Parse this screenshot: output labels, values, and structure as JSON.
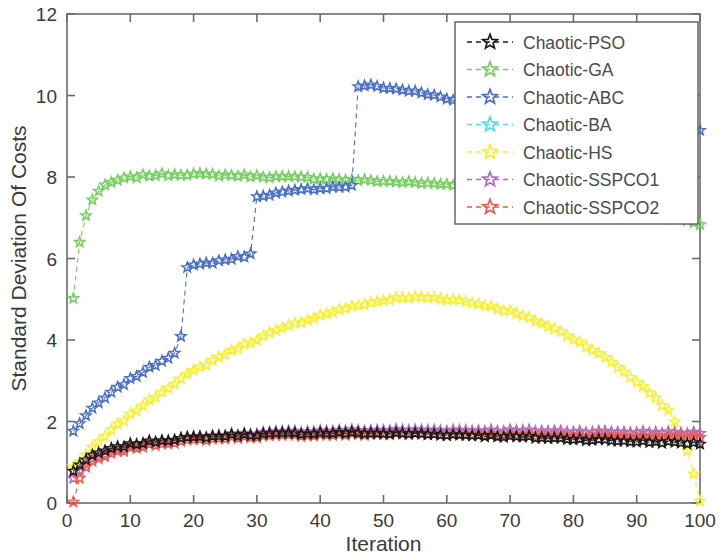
{
  "chart_data": {
    "type": "line",
    "title": "",
    "xlabel": "Iteration",
    "ylabel": "Standard Deviation Of Costs",
    "xlim": [
      0,
      100
    ],
    "ylim": [
      0,
      12
    ],
    "xticks": [
      0,
      10,
      20,
      30,
      40,
      50,
      60,
      70,
      80,
      90,
      100
    ],
    "yticks": [
      0,
      2,
      4,
      6,
      8,
      10,
      12
    ],
    "grid": false,
    "marker": "star",
    "linestyle": "dashed",
    "legend_position": "upper right",
    "series": [
      {
        "name": "Chaotic-PSO",
        "color": "#1a1a1a",
        "x": [
          1,
          2,
          3,
          4,
          5,
          6,
          7,
          8,
          9,
          10,
          12,
          14,
          16,
          18,
          20,
          22,
          25,
          28,
          30,
          34,
          38,
          42,
          46,
          50,
          55,
          60,
          65,
          70,
          75,
          80,
          85,
          90,
          95,
          98,
          100
        ],
        "values": [
          0.78,
          0.95,
          1.06,
          1.15,
          1.22,
          1.28,
          1.32,
          1.36,
          1.4,
          1.43,
          1.48,
          1.52,
          1.55,
          1.58,
          1.6,
          1.62,
          1.65,
          1.67,
          1.68,
          1.7,
          1.71,
          1.72,
          1.72,
          1.71,
          1.7,
          1.68,
          1.66,
          1.63,
          1.6,
          1.57,
          1.54,
          1.51,
          1.49,
          1.47,
          1.46
        ]
      },
      {
        "name": "Chaotic-GA",
        "color": "#76cf61",
        "x": [
          1,
          2,
          3,
          4,
          5,
          6,
          7,
          8,
          9,
          10,
          12,
          14,
          16,
          18,
          20,
          24,
          28,
          32,
          36,
          40,
          45,
          50,
          55,
          60,
          65,
          70,
          75,
          80,
          85,
          90,
          95,
          98,
          100
        ],
        "values": [
          5.02,
          6.4,
          7.05,
          7.45,
          7.65,
          7.78,
          7.86,
          7.92,
          7.96,
          7.99,
          8.03,
          8.05,
          8.06,
          8.07,
          8.07,
          8.05,
          8.03,
          8.01,
          7.99,
          7.97,
          7.93,
          7.9,
          7.86,
          7.82,
          7.77,
          7.7,
          7.62,
          7.52,
          7.4,
          7.26,
          7.05,
          6.92,
          6.85
        ]
      },
      {
        "name": "Chaotic-ABC",
        "color": "#4a6fc4",
        "x": [
          1,
          2,
          3,
          4,
          5,
          6,
          7,
          8,
          9,
          10,
          12,
          14,
          16,
          17,
          18,
          19,
          20,
          22,
          24,
          26,
          28,
          29,
          30,
          32,
          34,
          36,
          38,
          40,
          42,
          44,
          45,
          46,
          47,
          48,
          50,
          52,
          54,
          56,
          58,
          60,
          62,
          63,
          100
        ],
        "values": [
          1.76,
          1.96,
          2.14,
          2.3,
          2.45,
          2.58,
          2.7,
          2.82,
          2.93,
          3.03,
          3.22,
          3.4,
          3.58,
          3.7,
          4.08,
          5.78,
          5.82,
          5.88,
          5.94,
          6.0,
          6.06,
          6.1,
          7.52,
          7.58,
          7.62,
          7.66,
          7.7,
          7.73,
          7.75,
          7.77,
          7.78,
          10.22,
          10.25,
          10.24,
          10.2,
          10.16,
          10.12,
          10.06,
          10.0,
          9.92,
          9.84,
          9.8,
          9.15
        ]
      },
      {
        "name": "Chaotic-BA",
        "color": "#55dcec",
        "x": [],
        "values": []
      },
      {
        "name": "Chaotic-HS",
        "color": "#f7f035",
        "x": [
          1,
          2,
          3,
          4,
          5,
          6,
          8,
          10,
          12,
          14,
          16,
          18,
          20,
          24,
          28,
          32,
          36,
          40,
          44,
          48,
          52,
          55,
          58,
          62,
          66,
          70,
          74,
          78,
          82,
          86,
          90,
          93,
          95,
          97,
          98,
          99,
          100
        ],
        "values": [
          0.88,
          1.02,
          1.18,
          1.34,
          1.5,
          1.64,
          1.92,
          2.16,
          2.4,
          2.62,
          2.84,
          3.04,
          3.24,
          3.58,
          3.88,
          4.16,
          4.4,
          4.6,
          4.78,
          4.92,
          5.02,
          5.05,
          5.04,
          4.98,
          4.86,
          4.7,
          4.48,
          4.2,
          3.86,
          3.46,
          2.98,
          2.58,
          2.26,
          1.7,
          1.3,
          0.7,
          0.06
        ]
      },
      {
        "name": "Chaotic-SSPCO1",
        "color": "#b06ec0",
        "x": [
          1,
          2,
          3,
          4,
          5,
          6,
          7,
          8,
          9,
          10,
          12,
          14,
          16,
          18,
          20,
          24,
          28,
          32,
          36,
          40,
          45,
          50,
          55,
          60,
          65,
          70,
          75,
          80,
          85,
          90,
          95,
          98,
          100
        ],
        "values": [
          0.6,
          0.82,
          0.96,
          1.06,
          1.14,
          1.2,
          1.26,
          1.3,
          1.34,
          1.38,
          1.44,
          1.5,
          1.54,
          1.58,
          1.61,
          1.66,
          1.7,
          1.73,
          1.75,
          1.77,
          1.78,
          1.79,
          1.79,
          1.79,
          1.78,
          1.78,
          1.77,
          1.76,
          1.75,
          1.74,
          1.73,
          1.72,
          1.72
        ]
      },
      {
        "name": "Chaotic-SSPCO2",
        "color": "#f05a4a",
        "x": [
          1,
          2,
          3,
          4,
          5,
          6,
          7,
          8,
          9,
          10,
          12,
          14,
          16,
          18,
          20,
          24,
          28,
          32,
          36,
          40,
          45,
          50,
          55,
          60,
          65,
          70,
          75,
          80,
          85,
          90,
          95,
          98,
          100
        ],
        "values": [
          0.02,
          0.62,
          0.88,
          1.0,
          1.08,
          1.14,
          1.2,
          1.25,
          1.29,
          1.33,
          1.39,
          1.44,
          1.48,
          1.51,
          1.54,
          1.58,
          1.62,
          1.64,
          1.66,
          1.67,
          1.68,
          1.69,
          1.69,
          1.68,
          1.68,
          1.67,
          1.66,
          1.65,
          1.64,
          1.63,
          1.62,
          1.62,
          1.62
        ]
      }
    ]
  },
  "legend": {
    "entries": [
      {
        "label": "Chaotic-PSO",
        "color": "#1a1a1a"
      },
      {
        "label": "Chaotic-GA",
        "color": "#76cf61"
      },
      {
        "label": "Chaotic-ABC",
        "color": "#4a6fc4"
      },
      {
        "label": "Chaotic-BA",
        "color": "#55dcec"
      },
      {
        "label": "Chaotic-HS",
        "color": "#f7f035"
      },
      {
        "label": "Chaotic-SSPCO1",
        "color": "#b06ec0"
      },
      {
        "label": "Chaotic-SSPCO2",
        "color": "#f05a4a"
      }
    ]
  },
  "axes": {
    "x_title": "Iteration",
    "y_title": "Standard Deviation Of Costs",
    "x_tick_labels": [
      "0",
      "10",
      "20",
      "30",
      "40",
      "50",
      "60",
      "70",
      "80",
      "90",
      "100"
    ],
    "y_tick_labels": [
      "0",
      "2",
      "4",
      "6",
      "8",
      "10",
      "12"
    ]
  }
}
